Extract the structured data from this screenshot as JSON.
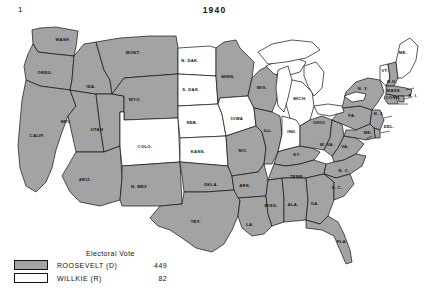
{
  "page": {
    "corner_number": "1",
    "year": "1940"
  },
  "legend": {
    "title": "Electoral Vote",
    "rows": [
      {
        "swatch": "gray-filled",
        "label": "ROOSEVELT (D)",
        "votes": "449"
      },
      {
        "swatch": "white-filled",
        "label": "WILLKIE (R)",
        "votes": "82"
      }
    ]
  },
  "colors": {
    "democrat_fill": "#a3a3a3",
    "republican_fill": "#ffffff",
    "border": "#111111",
    "background": "#ffffff"
  },
  "map": {
    "type": "us-electoral-college-map",
    "states": [
      {
        "code": "WASH",
        "label": "WASH.",
        "winner": "ROOSEVELT (D)",
        "fill": "gray",
        "lx": 63,
        "ly": 41
      },
      {
        "code": "OREG",
        "label": "OREG.",
        "winner": "ROOSEVELT (D)",
        "fill": "gray",
        "lx": 45,
        "ly": 74
      },
      {
        "code": "CALIF",
        "label": "CALIF.",
        "winner": "ROOSEVELT (D)",
        "fill": "gray",
        "lx": 37,
        "ly": 137
      },
      {
        "code": "NEV",
        "label": "NEV.",
        "winner": "ROOSEVELT (D)",
        "fill": "gray",
        "lx": 66,
        "ly": 123
      },
      {
        "code": "IDA",
        "label": "IDA.",
        "winner": "ROOSEVELT (D)",
        "fill": "gray",
        "lx": 91,
        "ly": 88
      },
      {
        "code": "UTAH",
        "label": "UTAH",
        "winner": "ROOSEVELT (D)",
        "fill": "gray",
        "lx": 97,
        "ly": 131
      },
      {
        "code": "ARIZ",
        "label": "ARIZ.",
        "winner": "ROOSEVELT (D)",
        "fill": "gray",
        "lx": 85,
        "ly": 181
      },
      {
        "code": "MONT",
        "label": "MONT.",
        "winner": "ROOSEVELT (D)",
        "fill": "gray",
        "lx": 133,
        "ly": 54
      },
      {
        "code": "WYO",
        "label": "WYO.",
        "winner": "ROOSEVELT (D)",
        "fill": "gray",
        "lx": 135,
        "ly": 101
      },
      {
        "code": "COLO",
        "label": "COLO.",
        "winner": "WILLKIE (R)",
        "fill": "white",
        "lx": 145,
        "ly": 148
      },
      {
        "code": "NMEX",
        "label": "N. MEX",
        "winner": "ROOSEVELT (D)",
        "fill": "gray",
        "lx": 139,
        "ly": 188
      },
      {
        "code": "NDAK",
        "label": "N. DAK.",
        "winner": "WILLKIE (R)",
        "fill": "white",
        "lx": 190,
        "ly": 62
      },
      {
        "code": "SDAK",
        "label": "S. DAK.",
        "winner": "WILLKIE (R)",
        "fill": "white",
        "lx": 191,
        "ly": 91
      },
      {
        "code": "NEB",
        "label": "NEB.",
        "winner": "WILLKIE (R)",
        "fill": "white",
        "lx": 192,
        "ly": 124
      },
      {
        "code": "KANS",
        "label": "KANS.",
        "winner": "WILLKIE (R)",
        "fill": "white",
        "lx": 198,
        "ly": 153
      },
      {
        "code": "OKLA",
        "label": "OKLA.",
        "winner": "ROOSEVELT (D)",
        "fill": "gray",
        "lx": 211,
        "ly": 186
      },
      {
        "code": "TEX",
        "label": "TEX.",
        "winner": "ROOSEVELT (D)",
        "fill": "gray",
        "lx": 196,
        "ly": 223
      },
      {
        "code": "MINN",
        "label": "MINN.",
        "winner": "ROOSEVELT (D)",
        "fill": "gray",
        "lx": 228,
        "ly": 78
      },
      {
        "code": "IOWA",
        "label": "IOWA",
        "winner": "WILLKIE (R)",
        "fill": "white",
        "lx": 237,
        "ly": 120
      },
      {
        "code": "MO",
        "label": "MO.",
        "winner": "ROOSEVELT (D)",
        "fill": "gray",
        "lx": 243,
        "ly": 152
      },
      {
        "code": "ARK",
        "label": "ARK.",
        "winner": "ROOSEVELT (D)",
        "fill": "gray",
        "lx": 245,
        "ly": 187
      },
      {
        "code": "LA",
        "label": "LA.",
        "winner": "ROOSEVELT (D)",
        "fill": "gray",
        "lx": 250,
        "ly": 226
      },
      {
        "code": "WIS",
        "label": "WIS.",
        "winner": "ROOSEVELT (D)",
        "fill": "gray",
        "lx": 262,
        "ly": 89
      },
      {
        "code": "ILL",
        "label": "ILL.",
        "winner": "ROOSEVELT (D)",
        "fill": "gray",
        "lx": 268,
        "ly": 132
      },
      {
        "code": "MISS",
        "label": "MISS.",
        "winner": "ROOSEVELT (D)",
        "fill": "gray",
        "lx": 271,
        "ly": 207
      },
      {
        "code": "MICH",
        "label": "MICH.",
        "winner": "WILLKIE (R)",
        "fill": "white",
        "lx": 300,
        "ly": 100
      },
      {
        "code": "IND",
        "label": "IND.",
        "winner": "WILLKIE (R)",
        "fill": "white",
        "lx": 292,
        "ly": 133
      },
      {
        "code": "KY",
        "label": "KY.",
        "winner": "ROOSEVELT (D)",
        "fill": "gray",
        "lx": 297,
        "ly": 156
      },
      {
        "code": "TENN",
        "label": "TENN.",
        "winner": "ROOSEVELT (D)",
        "fill": "gray",
        "lx": 297,
        "ly": 178
      },
      {
        "code": "ALA",
        "label": "ALA.",
        "winner": "ROOSEVELT (D)",
        "fill": "gray",
        "lx": 293,
        "ly": 206
      },
      {
        "code": "OHIO",
        "label": "OHIO",
        "winner": "ROOSEVELT (D)",
        "fill": "gray",
        "lx": 319,
        "ly": 124
      },
      {
        "code": "GA",
        "label": "GA.",
        "winner": "ROOSEVELT (D)",
        "fill": "gray",
        "lx": 315,
        "ly": 205
      },
      {
        "code": "FLA",
        "label": "FLA.",
        "winner": "ROOSEVELT (D)",
        "fill": "gray",
        "lx": 342,
        "ly": 243
      },
      {
        "code": "WVA",
        "label": "W. VA.",
        "winner": "ROOSEVELT (D)",
        "fill": "gray",
        "lx": 327,
        "ly": 146
      },
      {
        "code": "VA",
        "label": "VA.",
        "winner": "ROOSEVELT (D)",
        "fill": "gray",
        "lx": 345,
        "ly": 148
      },
      {
        "code": "NC",
        "label": "N. C.",
        "winner": "ROOSEVELT (D)",
        "fill": "gray",
        "lx": 344,
        "ly": 172
      },
      {
        "code": "SC",
        "label": "S. C.",
        "winner": "ROOSEVELT (D)",
        "fill": "gray",
        "lx": 337,
        "ly": 189
      },
      {
        "code": "PA",
        "label": "PA.",
        "winner": "ROOSEVELT (D)",
        "fill": "gray",
        "lx": 352,
        "ly": 117
      },
      {
        "code": "NY",
        "label": "N. Y.",
        "winner": "ROOSEVELT (D)",
        "fill": "gray",
        "lx": 363,
        "ly": 90
      },
      {
        "code": "VT",
        "label": "VT.",
        "winner": "WILLKIE (R)",
        "fill": "white",
        "lx": 385,
        "ly": 72
      },
      {
        "code": "NH",
        "label": "N.H.",
        "winner": "ROOSEVELT (D)",
        "fill": "gray",
        "lx": 392,
        "ly": 83
      },
      {
        "code": "ME",
        "label": "ME.",
        "winner": "WILLKIE (R)",
        "fill": "white",
        "lx": 403,
        "ly": 54
      },
      {
        "code": "MASS",
        "label": "MASS.",
        "winner": "ROOSEVELT (D)",
        "fill": "gray",
        "lx": 394,
        "ly": 92
      },
      {
        "code": "CONN",
        "label": "CONN.",
        "winner": "ROOSEVELT (D)",
        "fill": "gray",
        "lx": 393,
        "ly": 99
      },
      {
        "code": "RI",
        "label": "R. I.",
        "winner": "ROOSEVELT (D)",
        "fill": "gray",
        "lx": 413,
        "ly": 97
      },
      {
        "code": "NJ",
        "label": "N. J.",
        "winner": "ROOSEVELT (D)",
        "fill": "gray",
        "lx": 379,
        "ly": 115
      },
      {
        "code": "DEL",
        "label": "DEL.",
        "winner": "ROOSEVELT (D)",
        "fill": "gray",
        "lx": 389,
        "ly": 128
      },
      {
        "code": "MD",
        "label": "MD.",
        "winner": "ROOSEVELT (D)",
        "fill": "gray",
        "lx": 368,
        "ly": 134
      }
    ]
  },
  "chart_data": {
    "type": "map",
    "title": "1940",
    "legend_title": "Electoral Vote",
    "categories": [
      "ROOSEVELT (D)",
      "WILLKIE (R)"
    ],
    "values": [
      449,
      82
    ],
    "republican_states": [
      "ME.",
      "VT.",
      "MICH.",
      "IND.",
      "IOWA",
      "N. DAK.",
      "S. DAK.",
      "NEB.",
      "KANS.",
      "COLO."
    ]
  }
}
